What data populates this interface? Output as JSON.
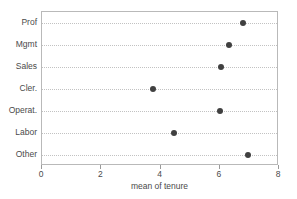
{
  "chart_data": {
    "type": "scatter",
    "plot_style": "dot-plot",
    "title": "",
    "xlabel": "mean of tenure",
    "ylabel": "",
    "categories": [
      "Prof",
      "Mgmt",
      "Sales",
      "Cler.",
      "Operat.",
      "Labor",
      "Other"
    ],
    "values": [
      6.8,
      6.3,
      6.05,
      3.75,
      6.0,
      4.45,
      6.95
    ],
    "xlim": [
      0,
      8
    ],
    "xticks": [
      0,
      2,
      4,
      6,
      8
    ],
    "xtick_labels": [
      "0",
      "2",
      "4",
      "6",
      "8"
    ],
    "grid": "horizontal-dotted",
    "legend": "none",
    "marker": {
      "shape": "circle",
      "color": "#404040",
      "size_px": 6
    },
    "colors": {
      "marker": "#404040",
      "gridline": "#c2c2c2",
      "frame": "#b9b9b9",
      "text": "#4a4a4a",
      "background": "#ffffff"
    }
  }
}
